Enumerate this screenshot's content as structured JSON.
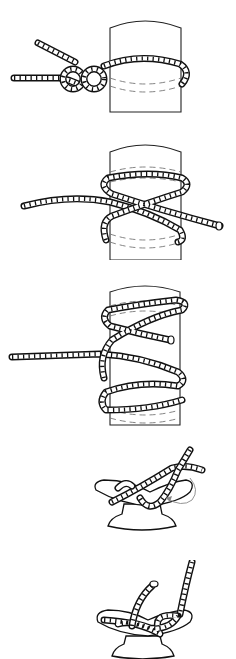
{
  "figure": {
    "type": "knot-tying illustration sequence",
    "steps": [
      {
        "index": 1,
        "subject": "post",
        "description": "Two half hitches around a post, rope ends to the left"
      },
      {
        "index": 2,
        "subject": "post",
        "description": "Rope wrapped around post forming a cross (figure-eight) turn"
      },
      {
        "index": 3,
        "subject": "post",
        "description": "Rope wrapped multiple times around post with crossing turns"
      },
      {
        "index": 4,
        "subject": "cleat",
        "description": "Rope crossing over cleat horns with arrow indicating wrap direction"
      },
      {
        "index": 5,
        "subject": "cleat",
        "description": "Finished cleat hitch with tucked end"
      }
    ],
    "colors": {
      "line": "#111111",
      "dash": "#777777",
      "arrow": "#888888",
      "background": "#ffffff"
    }
  }
}
